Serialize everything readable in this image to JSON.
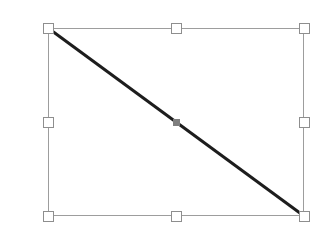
{
  "app": {
    "title": "Line Object Selection",
    "canvas_width": 330,
    "canvas_height": 239,
    "background_color": "#ffffff"
  },
  "selection": {
    "label": "Selected object",
    "shape_type": "line",
    "bounding_box": {
      "x": 48,
      "y": 28,
      "width": 256,
      "height": 188,
      "border_color": "#9d9d9d",
      "border_width": 1
    },
    "handle_style": {
      "size": 11,
      "fill_color": "#ffffff",
      "border_color": "#8e8e8e",
      "border_width": 1
    },
    "handles": [
      {
        "name": "top-left",
        "label": "Resize top-left",
        "cx": 48,
        "cy": 28,
        "cursor": "nwse-resize"
      },
      {
        "name": "top-center",
        "label": "Resize top",
        "cx": 176,
        "cy": 28,
        "cursor": "ns-resize"
      },
      {
        "name": "top-right",
        "label": "Resize top-right",
        "cx": 304,
        "cy": 28,
        "cursor": "nesw-resize"
      },
      {
        "name": "middle-left",
        "label": "Resize left",
        "cx": 48,
        "cy": 122,
        "cursor": "ew-resize"
      },
      {
        "name": "middle-right",
        "label": "Resize right",
        "cx": 304,
        "cy": 122,
        "cursor": "ew-resize"
      },
      {
        "name": "bottom-left",
        "label": "Resize bottom-left",
        "cx": 48,
        "cy": 216,
        "cursor": "nesw-resize"
      },
      {
        "name": "bottom-center",
        "label": "Resize bottom",
        "cx": 176,
        "cy": 216,
        "cursor": "ns-resize"
      },
      {
        "name": "bottom-right",
        "label": "Resize bottom-right",
        "cx": 304,
        "cy": 216,
        "cursor": "nwse-resize"
      }
    ],
    "midpoint_marker": {
      "label": "Midpoint handle",
      "cx": 176,
      "cy": 122,
      "size": 7,
      "color": "#7e7e7e"
    }
  },
  "line_object": {
    "label": "Diagonal line",
    "x1": 48,
    "y1": 28,
    "x2": 304,
    "y2": 216,
    "stroke_color": "#1d1d1d",
    "stroke_width": 3
  }
}
